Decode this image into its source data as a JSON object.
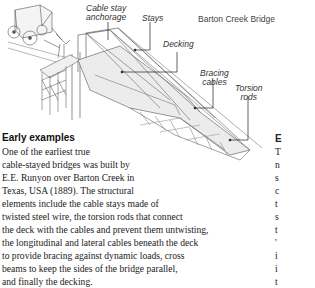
{
  "figure": {
    "title": "Barton Creek Bridge",
    "labels": {
      "anchorage_line1": "Cable stay",
      "anchorage_line2": "anchorage",
      "stays": "Stays",
      "decking": "Decking",
      "bracing_line1": "Bracing",
      "bracing_line2": "cables",
      "torsion_line1": "Torsion",
      "torsion_line2": "rods"
    }
  },
  "article": {
    "heading": "Early examples",
    "lines": [
      "One of the earliest true",
      "cable-stayed bridges was built by",
      "E.E. Runyon over Barton Creek in",
      "Texas, USA (1889). The structural",
      "elements include the cable stays made of",
      "twisted steel wire, the torsion rods that connect",
      "the deck with the cables and prevent them untwisting,",
      "the longitudinal and lateral cables beneath the deck",
      "to provide bracing against dynamic loads, cross",
      "beams to keep the sides of the bridge parallel,",
      "and finally the decking."
    ]
  },
  "next_column": {
    "heading_fragment": "E",
    "line_fragments": [
      "T",
      "n",
      "s",
      "c",
      "t",
      "s",
      "t",
      "'",
      "i",
      "i",
      "t"
    ]
  }
}
